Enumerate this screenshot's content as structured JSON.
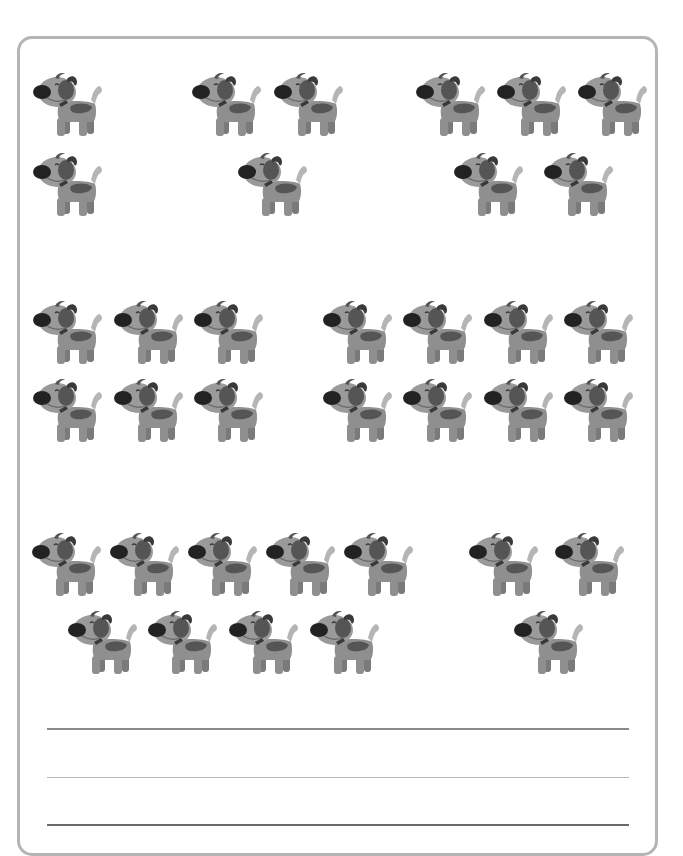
{
  "worksheet": {
    "subject": "counting-dogs",
    "colors": {
      "frame": "#b4b4b4",
      "dog_body": "#8f8f8f",
      "dog_head": "#9a9a9a",
      "dog_patch": "#555555",
      "dog_nose": "#222222",
      "dog_collar": "#3a3a3a",
      "dog_tail": "#b5b5b5",
      "dog_far_legs": "#7a7a7a"
    },
    "groups": [
      {
        "name": "group-1",
        "clusters": [
          {
            "count": 2,
            "dogs": [
              {
                "x": 33,
                "y": 70
              },
              {
                "x": 33,
                "y": 150
              }
            ]
          },
          {
            "count": 3,
            "dogs": [
              {
                "x": 192,
                "y": 70
              },
              {
                "x": 274,
                "y": 70
              },
              {
                "x": 238,
                "y": 150
              }
            ]
          },
          {
            "count": 5,
            "dogs": [
              {
                "x": 416,
                "y": 70
              },
              {
                "x": 497,
                "y": 70
              },
              {
                "x": 578,
                "y": 70
              },
              {
                "x": 454,
                "y": 150
              },
              {
                "x": 544,
                "y": 150
              }
            ]
          }
        ]
      },
      {
        "name": "group-2",
        "clusters": [
          {
            "count": 6,
            "dogs": [
              {
                "x": 33,
                "y": 298
              },
              {
                "x": 114,
                "y": 298
              },
              {
                "x": 194,
                "y": 298
              },
              {
                "x": 33,
                "y": 376
              },
              {
                "x": 114,
                "y": 376
              },
              {
                "x": 194,
                "y": 376
              }
            ]
          },
          {
            "count": 8,
            "dogs": [
              {
                "x": 323,
                "y": 298
              },
              {
                "x": 403,
                "y": 298
              },
              {
                "x": 484,
                "y": 298
              },
              {
                "x": 564,
                "y": 298
              },
              {
                "x": 323,
                "y": 376
              },
              {
                "x": 403,
                "y": 376
              },
              {
                "x": 484,
                "y": 376
              },
              {
                "x": 564,
                "y": 376
              }
            ]
          }
        ]
      },
      {
        "name": "group-3",
        "clusters": [
          {
            "count": 9,
            "dogs": [
              {
                "x": 32,
                "y": 530
              },
              {
                "x": 110,
                "y": 530
              },
              {
                "x": 188,
                "y": 530
              },
              {
                "x": 266,
                "y": 530
              },
              {
                "x": 344,
                "y": 530
              },
              {
                "x": 68,
                "y": 608
              },
              {
                "x": 148,
                "y": 608
              },
              {
                "x": 229,
                "y": 608
              },
              {
                "x": 310,
                "y": 608
              }
            ]
          },
          {
            "count": 3,
            "dogs": [
              {
                "x": 469,
                "y": 530
              },
              {
                "x": 555,
                "y": 530
              },
              {
                "x": 514,
                "y": 608
              }
            ]
          }
        ]
      }
    ],
    "answer_lines": [
      {
        "name": "answer-line-1",
        "value": ""
      },
      {
        "name": "answer-line-2",
        "value": ""
      },
      {
        "name": "answer-line-3",
        "value": ""
      }
    ]
  }
}
